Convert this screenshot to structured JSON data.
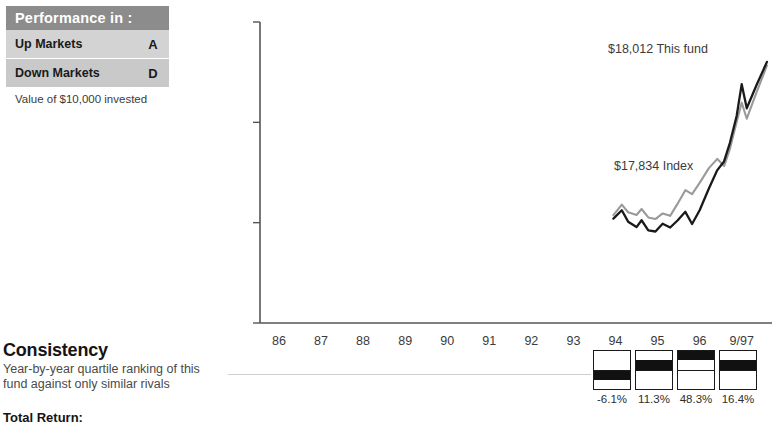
{
  "performance_panel": {
    "header": "Performance in :",
    "rows": [
      {
        "label": "Up Markets",
        "grade": "A"
      },
      {
        "label": "Down Markets",
        "grade": "D"
      }
    ],
    "note": "Value of $10,000 invested"
  },
  "consistency": {
    "title": "Consistency",
    "description_line1": "Year-by-year quartile ranking of this",
    "description_line2": "fund against only similar rivals",
    "total_return_label": "Total Return:"
  },
  "quartiles": {
    "columns": [
      {
        "year": "94",
        "quartile": 3,
        "return": "-6.1%"
      },
      {
        "year": "95",
        "quartile": 2,
        "return": "11.3%"
      },
      {
        "year": "96",
        "quartile": 1,
        "return": "48.3%"
      },
      {
        "year": "9/97",
        "quartile": 2,
        "return": "16.4%"
      }
    ]
  },
  "chart_data": {
    "type": "line",
    "title": "",
    "xlabel": "",
    "ylabel": "",
    "ylim": [
      5000,
      20000
    ],
    "yticks": [
      20000,
      15000,
      10000,
      5000
    ],
    "ytick_labels": [
      "$20,000",
      "$15,000",
      "$10,000",
      "$5,000"
    ],
    "grid": false,
    "legend_position": "inline-annotation",
    "x": [
      "86",
      "87",
      "88",
      "89",
      "90",
      "91",
      "92",
      "93",
      "94",
      "95",
      "96",
      "9/97"
    ],
    "x_tick_labels": [
      "86",
      "87",
      "88",
      "89",
      "90",
      "91",
      "92",
      "93",
      "94",
      "95",
      "96",
      "9/97"
    ],
    "annotations": [
      {
        "text": "$18,012 This fund",
        "value": 18012,
        "series": "This fund"
      },
      {
        "text": "$17,834 Index",
        "value": 17834,
        "series": "Index"
      }
    ],
    "series": [
      {
        "name": "This fund",
        "color": "#1a1a1a",
        "final_value": 18012,
        "points": [
          [
            1993.95,
            10200
          ],
          [
            1994.15,
            10620
          ],
          [
            1994.3,
            10050
          ],
          [
            1994.5,
            9780
          ],
          [
            1994.62,
            10120
          ],
          [
            1994.78,
            9620
          ],
          [
            1994.95,
            9560
          ],
          [
            1995.12,
            9950
          ],
          [
            1995.3,
            9760
          ],
          [
            1995.48,
            10120
          ],
          [
            1995.66,
            10540
          ],
          [
            1995.82,
            9930
          ],
          [
            1996.0,
            10620
          ],
          [
            1996.22,
            11700
          ],
          [
            1996.42,
            12620
          ],
          [
            1996.58,
            13050
          ],
          [
            1996.72,
            13980
          ],
          [
            1996.88,
            15320
          ],
          [
            1997.0,
            16900
          ],
          [
            1997.12,
            15700
          ],
          [
            1997.35,
            16850
          ],
          [
            1997.6,
            18012
          ]
        ]
      },
      {
        "name": "Index",
        "color": "#9a9a9a",
        "final_value": 17834,
        "points": [
          [
            1993.95,
            10380
          ],
          [
            1994.15,
            10900
          ],
          [
            1994.3,
            10520
          ],
          [
            1994.5,
            10380
          ],
          [
            1994.62,
            10680
          ],
          [
            1994.78,
            10260
          ],
          [
            1994.95,
            10180
          ],
          [
            1995.12,
            10460
          ],
          [
            1995.3,
            10340
          ],
          [
            1995.48,
            10960
          ],
          [
            1995.66,
            11620
          ],
          [
            1995.82,
            11420
          ],
          [
            1996.0,
            11980
          ],
          [
            1996.22,
            12720
          ],
          [
            1996.42,
            13180
          ],
          [
            1996.58,
            12820
          ],
          [
            1996.72,
            13680
          ],
          [
            1996.88,
            15020
          ],
          [
            1997.0,
            15980
          ],
          [
            1997.12,
            15180
          ],
          [
            1997.35,
            16480
          ],
          [
            1997.6,
            17834
          ]
        ]
      }
    ]
  }
}
